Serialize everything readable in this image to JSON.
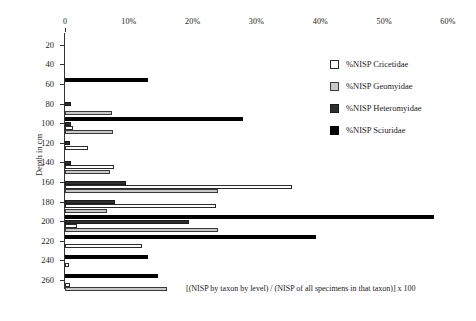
{
  "chart_data": {
    "type": "bar",
    "orientation": "horizontal",
    "title": "",
    "xlabel": "",
    "ylabel": "Depth in cm",
    "xlim": [
      0,
      60
    ],
    "ylim": [
      10,
      270
    ],
    "grid": false,
    "legend_position": "upper-right",
    "xticks": [
      "0",
      "10%",
      "20%",
      "30%",
      "40%",
      "50%",
      "60%"
    ],
    "xtick_values": [
      0,
      10,
      20,
      30,
      40,
      50,
      60
    ],
    "categories": [
      20,
      40,
      60,
      80,
      100,
      120,
      140,
      160,
      180,
      200,
      220,
      240,
      260
    ],
    "yticks": [
      "20",
      "40",
      "60",
      "80",
      "100",
      "120",
      "140",
      "160",
      "180",
      "200",
      "220",
      "240",
      "260"
    ],
    "series": [
      {
        "name": "%NISP Cricetidae",
        "color": "#ffffff",
        "values": [
          0,
          0,
          0,
          0,
          1.2,
          3.6,
          7.6,
          35.6,
          23.6,
          1.9,
          12.1,
          0.7,
          0.8
        ]
      },
      {
        "name": "%NISP Geomyidae",
        "color": "#c8c8c8",
        "values": [
          0,
          0,
          0,
          7.3,
          7.5,
          0,
          7.0,
          23.9,
          6.6,
          24.0,
          0,
          0,
          16.0
        ]
      },
      {
        "name": "%NISP Heteromyidae",
        "color": "#2e2e2e",
        "values": [
          0,
          0,
          0,
          0.9,
          1.0,
          0.8,
          1.0,
          9.6,
          7.8,
          19.4,
          0,
          0,
          0
        ]
      },
      {
        "name": "%NISP Sciuridae",
        "color": "#000000",
        "values": [
          0,
          0,
          13.0,
          0,
          27.9,
          0,
          0,
          0,
          0,
          57.8,
          39.3,
          13.0,
          14.6
        ]
      }
    ],
    "annotation": "[(NISP by taxon by level) / (NISP of all specimens in that taxon)] x 100"
  }
}
